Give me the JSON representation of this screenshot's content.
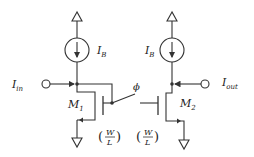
{
  "diagram": {
    "type": "circuit-schematic",
    "title": "",
    "colors": {
      "wire": "#333333",
      "text": "#222222",
      "background": "#ffffff"
    },
    "labels": {
      "ib_left": {
        "base": "I",
        "sub": "B"
      },
      "ib_right": {
        "base": "I",
        "sub": "B"
      },
      "iin": {
        "base": "I",
        "sub": "in"
      },
      "iout": {
        "base": "I",
        "sub": "out"
      },
      "m1": {
        "base": "M",
        "sub": "1"
      },
      "m2": {
        "base": "M",
        "sub": "2"
      },
      "phi": "ϕ",
      "wl_left": {
        "open": "(",
        "num": "W",
        "den": "L",
        "close": ")"
      },
      "wl_right": {
        "open": "(",
        "num": "W",
        "den": "L",
        "close": ")"
      }
    },
    "components": [
      {
        "id": "vdd-left",
        "kind": "supply"
      },
      {
        "id": "vdd-right",
        "kind": "supply"
      },
      {
        "id": "current-source-left",
        "kind": "current-source",
        "label": "I_B"
      },
      {
        "id": "current-source-right",
        "kind": "current-source",
        "label": "I_B"
      },
      {
        "id": "m1",
        "kind": "nmos",
        "label": "M1",
        "size": "W/L"
      },
      {
        "id": "m2",
        "kind": "nmos",
        "label": "M2",
        "size": "W/L"
      },
      {
        "id": "switch",
        "kind": "switch",
        "label": "ϕ"
      },
      {
        "id": "input-terminal",
        "kind": "terminal",
        "label": "I_in"
      },
      {
        "id": "output-terminal",
        "kind": "terminal",
        "label": "I_out"
      },
      {
        "id": "gnd-left",
        "kind": "ground"
      },
      {
        "id": "gnd-right",
        "kind": "ground"
      }
    ]
  }
}
